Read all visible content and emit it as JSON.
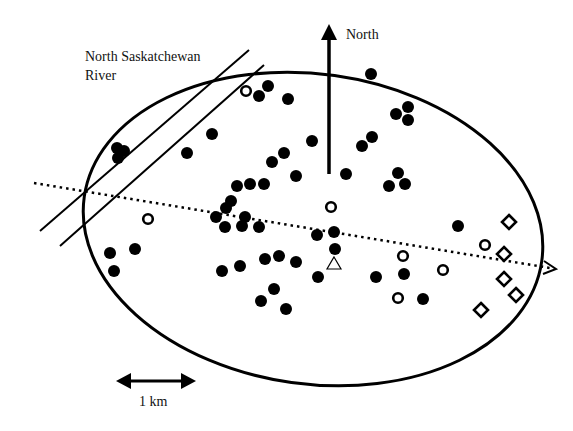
{
  "labels": {
    "river_line1": "North Saskatchewan",
    "river_line2": "River",
    "north": "North",
    "scale": "1 km"
  },
  "colors": {
    "ink": "#000000",
    "background": "#ffffff"
  },
  "study_area": {
    "shape": "ellipse",
    "cx": 313,
    "cy": 229,
    "rx": 231,
    "ry": 155,
    "rotation_deg": 8
  },
  "river_banks": [
    {
      "x1": 40,
      "y1": 231,
      "x2": 249,
      "y2": 50
    },
    {
      "x1": 60,
      "y1": 246,
      "x2": 264,
      "y2": 65
    }
  ],
  "north_arrow": {
    "x": 329,
    "y_tail": 174,
    "y_head": 24
  },
  "axis_line": {
    "style": "dotted",
    "x1": 34,
    "y1": 183,
    "x2": 556,
    "y2": 269
  },
  "scale_bar": {
    "x1": 116,
    "x2": 196,
    "y": 381,
    "length_label": "1 km"
  },
  "legend_symbols": [
    "filled-circle",
    "open-circle",
    "open-diamond",
    "open-triangle"
  ],
  "points": {
    "filled_circles": [
      [
        268,
        86
      ],
      [
        259,
        96
      ],
      [
        288,
        99
      ],
      [
        371,
        74
      ],
      [
        396,
        114
      ],
      [
        408,
        107
      ],
      [
        408,
        120
      ],
      [
        372,
        137
      ],
      [
        362,
        146
      ],
      [
        117,
        148
      ],
      [
        124,
        151
      ],
      [
        118,
        158
      ],
      [
        187,
        153
      ],
      [
        212,
        134
      ],
      [
        312,
        141
      ],
      [
        284,
        153
      ],
      [
        272,
        162
      ],
      [
        296,
        176
      ],
      [
        346,
        174
      ],
      [
        264,
        184
      ],
      [
        250,
        184
      ],
      [
        237,
        186
      ],
      [
        398,
        173
      ],
      [
        389,
        186
      ],
      [
        405,
        184
      ],
      [
        231,
        201
      ],
      [
        226,
        208
      ],
      [
        216,
        217
      ],
      [
        245,
        217
      ],
      [
        225,
        227
      ],
      [
        242,
        226
      ],
      [
        259,
        227
      ],
      [
        317,
        235
      ],
      [
        334,
        232
      ],
      [
        335,
        249
      ],
      [
        458,
        226
      ],
      [
        110,
        253
      ],
      [
        135,
        249
      ],
      [
        114,
        271
      ],
      [
        222,
        271
      ],
      [
        240,
        266
      ],
      [
        265,
        259
      ],
      [
        279,
        256
      ],
      [
        296,
        262
      ],
      [
        318,
        277
      ],
      [
        274,
        289
      ],
      [
        261,
        301
      ],
      [
        286,
        309
      ],
      [
        376,
        277
      ],
      [
        404,
        274
      ],
      [
        423,
        299
      ]
    ],
    "open_circles": [
      [
        246,
        91
      ],
      [
        148,
        219
      ],
      [
        331,
        207
      ],
      [
        403,
        256
      ],
      [
        485,
        245
      ],
      [
        443,
        270
      ],
      [
        398,
        298
      ]
    ],
    "open_diamonds": [
      [
        509,
        222
      ],
      [
        504,
        254
      ],
      [
        504,
        279
      ],
      [
        516,
        295
      ],
      [
        481,
        310
      ]
    ],
    "open_triangles": [
      [
        334,
        264
      ]
    ]
  }
}
